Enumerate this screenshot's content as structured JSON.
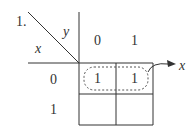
{
  "problem_number": "1.",
  "kmap": {
    "row_variable": "x",
    "col_variable": "y",
    "col_headers": [
      "0",
      "1"
    ],
    "row_headers": [
      "0",
      "1"
    ],
    "cells": [
      [
        "1",
        "1"
      ],
      [
        "",
        ""
      ]
    ],
    "group_output_label": "x"
  }
}
